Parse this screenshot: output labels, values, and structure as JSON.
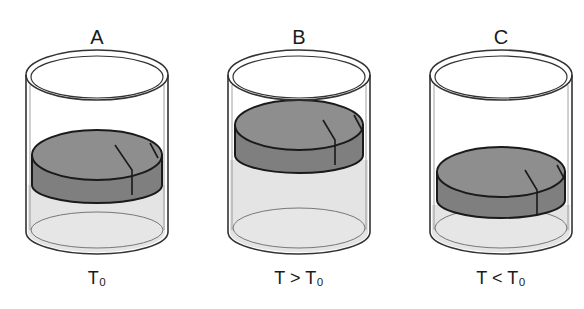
{
  "figure": {
    "type": "diagram",
    "colors": {
      "liquid": "#e4e4e4",
      "puck": "#8c8c8c",
      "puck_side": "#7a7a7a",
      "outline": "#1a1a1a",
      "glass": "#555555"
    },
    "beakers": [
      {
        "label": "A",
        "condition": "T₀",
        "puck_position": "middle"
      },
      {
        "label": "B",
        "condition": "T > T₀",
        "puck_position": "high"
      },
      {
        "label": "C",
        "condition": "T < T₀",
        "puck_position": "low"
      }
    ]
  }
}
